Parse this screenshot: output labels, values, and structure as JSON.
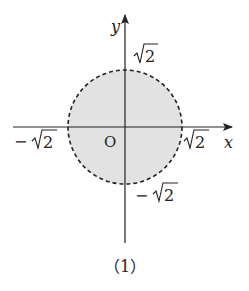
{
  "figure": {
    "caption": "（1）",
    "axes": {
      "x_label": "x",
      "y_label": "y",
      "origin_label": "O"
    },
    "region": {
      "shape": "circle",
      "boundary": "dashed",
      "fill": "#e0e0e0",
      "stroke": "#222222",
      "radius_label": "√2"
    },
    "tick_labels": {
      "x_pos": "2",
      "x_neg": "2",
      "y_pos": "2",
      "y_neg": "2",
      "neg_sign": "−"
    }
  }
}
